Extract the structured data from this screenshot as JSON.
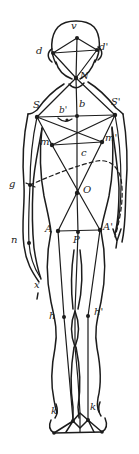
{
  "colors": {
    "ink": "#1c1c1c",
    "paper": "#ffffff"
  },
  "labels": {
    "v": "v",
    "d": "d",
    "d_prime": "d'",
    "N": "N",
    "S": "S",
    "S_prime": "S'",
    "b": "b",
    "b_prime": "b'",
    "m": "m",
    "m_prime": "m'",
    "c": "c",
    "g": "g",
    "O": "O",
    "A": "A",
    "A_prime": "A'",
    "P": "P",
    "n": "n",
    "x": "x",
    "h": "h",
    "h_prime": "h'",
    "k": "k",
    "k_prime": "k'"
  }
}
